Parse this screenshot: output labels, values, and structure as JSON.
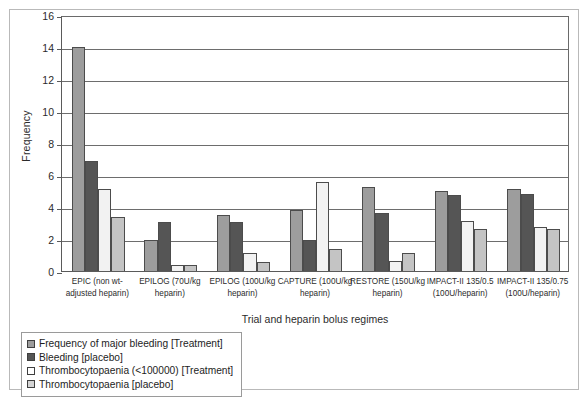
{
  "chart_data": {
    "type": "bar",
    "title": "",
    "xlabel": "Trial and heparin bolus regimes",
    "ylabel": "Frequency",
    "ylim": [
      0,
      16
    ],
    "yticks": [
      0,
      2,
      4,
      6,
      8,
      10,
      12,
      14,
      16
    ],
    "grid": true,
    "legend_position": "below-left",
    "categories": [
      "EPIC (non wt-adjusted heparin)",
      "EPILOG (70U/kg heparin)",
      "EPILOG (100U/kg heparin)",
      "CAPTURE (100U/kg heparin)",
      "RESTORE (150U/kg heparin)",
      "IMPACT-II 135/0.5 (100U/heparin)",
      "IMPACT-II 135/0.75 (100U/heparin)"
    ],
    "category_lines": [
      [
        "EPIC (non wt-",
        "adjusted heparin)"
      ],
      [
        "EPILOG (70U/kg",
        "heparin)"
      ],
      [
        "EPILOG (100U/kg",
        "heparin)"
      ],
      [
        "CAPTURE (100U/kg",
        "heparin)"
      ],
      [
        "RESTORE (150U/kg",
        "heparin)"
      ],
      [
        "IMPACT-II 135/0.5",
        "(100U/heparin)"
      ],
      [
        "IMPACT-II 135/0.75",
        "(100U/heparin)"
      ]
    ],
    "series": [
      {
        "name": "Frequency of major bleeding [Treatment]",
        "color": "#9d9d9d",
        "values": [
          14.0,
          1.95,
          3.5,
          3.8,
          5.25,
          5.0,
          5.15
        ]
      },
      {
        "name": "Bleeding [placebo]",
        "color": "#555555",
        "values": [
          6.9,
          3.05,
          3.05,
          1.95,
          3.6,
          4.75,
          4.8
        ]
      },
      {
        "name": "Thrombocytopaenia (<100000) [Treatment]",
        "color": "#f2f2f2",
        "values": [
          5.15,
          0.4,
          1.1,
          5.55,
          0.65,
          3.15,
          2.75
        ]
      },
      {
        "name": "Thrombocytopaenia [placebo]",
        "color": "#c4c4c4",
        "values": [
          3.4,
          0.4,
          0.55,
          1.35,
          1.1,
          2.6,
          2.6
        ]
      }
    ]
  },
  "legend": {
    "items": [
      {
        "label": "Frequency of major bleeding [Treatment]",
        "color": "#9d9d9d"
      },
      {
        "label": "Bleeding [placebo]",
        "color": "#555555"
      },
      {
        "label": "Thrombocytopaenia (<100000) [Treatment]",
        "color": "#ffffff"
      },
      {
        "label": "Thrombocytopaenia [placebo]",
        "color": "#d4d4d4"
      }
    ]
  },
  "axes": {
    "y_title": "Frequency",
    "x_title": "Trial and heparin bolus regimes"
  }
}
